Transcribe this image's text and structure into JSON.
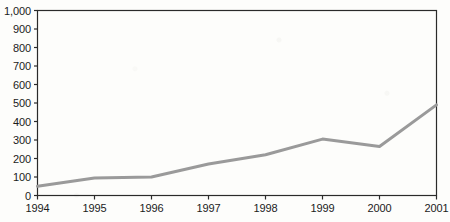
{
  "chart_data": {
    "type": "line",
    "title": "",
    "subtitle": "",
    "xlabel": "",
    "ylabel": "",
    "categories": [
      "1994",
      "1995",
      "1996",
      "1997",
      "1998",
      "1999",
      "2000",
      "2001"
    ],
    "x": [
      1994,
      1995,
      1996,
      1997,
      1998,
      1999,
      2000,
      2001
    ],
    "values": [
      50,
      95,
      100,
      170,
      220,
      305,
      265,
      490
    ],
    "series": [
      {
        "name": "",
        "values": [
          50,
          95,
          100,
          170,
          220,
          305,
          265,
          490
        ],
        "color": "#9a9a9a"
      }
    ],
    "ylim": [
      0,
      1000
    ],
    "ytick_values": [
      0,
      100,
      200,
      300,
      400,
      500,
      600,
      700,
      800,
      900,
      1000
    ],
    "ytick_labels": [
      "0",
      "100",
      "200",
      "300",
      "400",
      "500",
      "600",
      "700",
      "800",
      "900",
      "1,000"
    ],
    "xtick_labels": [
      "1994",
      "1995",
      "1996",
      "1997",
      "1998",
      "1999",
      "2000",
      "2001"
    ],
    "grid": false,
    "legend": false,
    "legend_position": "none",
    "frame": "box",
    "annotations": []
  },
  "style": {
    "line_color": "#9a9a9a",
    "axis_color": "#2a2a2a",
    "text_color": "#1b1b1b",
    "background_color": "#fdfdfb"
  }
}
